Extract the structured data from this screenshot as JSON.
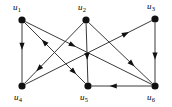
{
  "figure": {
    "type": "directed-graph",
    "background_color": "#ffffff",
    "edge_color": "#3a3a3a",
    "node_color": "#111111",
    "label_color": "#000000",
    "width": 172,
    "height": 107
  },
  "nodes": [
    {
      "id": "u1",
      "label": "u",
      "subscript": "1",
      "x": 22,
      "y": 20,
      "label_x": 13,
      "label_y": 3,
      "radius": 3.6
    },
    {
      "id": "u2",
      "label": "u",
      "subscript": "2",
      "x": 86,
      "y": 20,
      "label_x": 78,
      "label_y": 3,
      "radius": 3.6
    },
    {
      "id": "u3",
      "label": "u",
      "subscript": "3",
      "x": 155,
      "y": 19,
      "label_x": 147,
      "label_y": 2,
      "radius": 3.6
    },
    {
      "id": "u4",
      "label": "u",
      "subscript": "4",
      "x": 22,
      "y": 86,
      "label_x": 14,
      "label_y": 93,
      "radius": 3.6
    },
    {
      "id": "u5",
      "label": "u",
      "subscript": "5",
      "x": 88,
      "y": 86,
      "label_x": 80,
      "label_y": 93,
      "radius": 3.6
    },
    {
      "id": "u6",
      "label": "u",
      "subscript": "6",
      "x": 155,
      "y": 86,
      "label_x": 147,
      "label_y": 93,
      "radius": 3.6
    }
  ],
  "edges": [
    {
      "id": "e1",
      "from": "u1",
      "to": "u4",
      "arrow_at": 0.45
    },
    {
      "id": "e2",
      "from": "u2",
      "to": "u5",
      "arrow_at": 0.62
    },
    {
      "id": "e3",
      "from": "u3",
      "to": "u6",
      "arrow_at": 0.62
    },
    {
      "id": "e4",
      "from": "u1",
      "to": "u5",
      "arrow_at": 0.85
    },
    {
      "id": "e5",
      "from": "u1",
      "to": "u6",
      "arrow_at": 0.4
    },
    {
      "id": "e6",
      "from": "u2",
      "to": "u4",
      "arrow_at": 0.8
    },
    {
      "id": "e7",
      "from": "u2",
      "to": "u6",
      "arrow_at": 0.72
    },
    {
      "id": "e8",
      "from": "u4",
      "to": "u3",
      "arrow_at": 0.82
    },
    {
      "id": "e9",
      "from": "u6",
      "to": "u5",
      "arrow_at": 0.7
    },
    {
      "id": "e10",
      "from": "u5",
      "to": "u1",
      "arrow_at": 0.72
    }
  ]
}
